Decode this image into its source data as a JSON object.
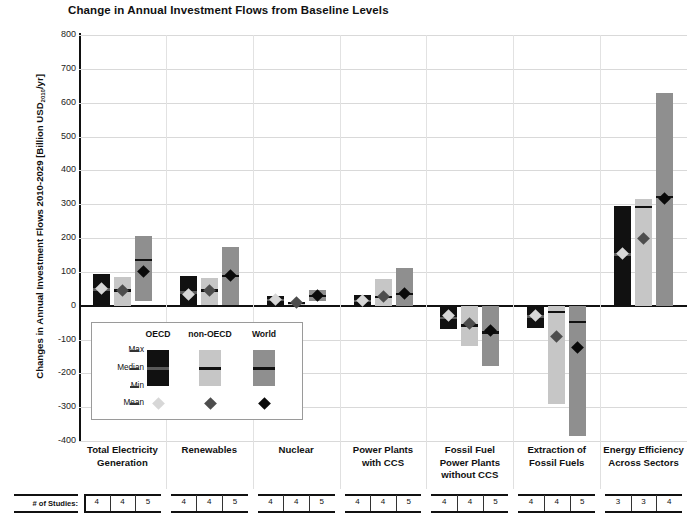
{
  "chart_data": {
    "type": "bar",
    "title": "Change in Annual Investment Flows from Baseline Levels",
    "ylabel": "Changes in Annual Investment Flows 2010-2029 [Billion USD2010/yr]",
    "ylabel_main": "Changes in Annual Investment Flows 2010-2029 [Billion USD",
    "ylabel_sub": "2010",
    "ylabel_tail": "/yr]",
    "xlabel": "",
    "ylim": [
      -400,
      800
    ],
    "ytick_values": [
      800,
      700,
      600,
      500,
      400,
      300,
      200,
      100,
      0,
      -100,
      -200,
      -300,
      -400
    ],
    "ytick_labels": [
      "800",
      "700",
      "600",
      "500",
      "400",
      "300",
      "200",
      "100",
      "0",
      "-100",
      "-200",
      "-300",
      "-400"
    ],
    "grid": true,
    "legend_position": "inside-lower-left",
    "series_names": [
      "OECD",
      "non-OECD",
      "World"
    ],
    "series_colors": [
      "#111111",
      "#c6c6c6",
      "#8f8f8f"
    ],
    "mean_marker_colors": [
      "#d7d7d7",
      "#4d4d4d",
      "#0a0a0a"
    ],
    "stat_labels": [
      "Max",
      "Median",
      "Min",
      "Mean"
    ],
    "studies_row_label": "# of Studies:",
    "categories": [
      "Total Electricity Generation",
      "Renewables",
      "Nuclear",
      "Power Plants with CCS",
      "Fossil Fuel Power Plants without CCS",
      "Extraction of Fossil Fuels",
      "Energy Efficiency Across Sectors"
    ],
    "category_lines": [
      [
        "Total Electricity",
        "Generation"
      ],
      [
        "Renewables"
      ],
      [
        "Nuclear"
      ],
      [
        "Power Plants",
        "with CCS"
      ],
      [
        "Fossil Fuel",
        "Power Plants",
        "without CCS"
      ],
      [
        "Extraction of",
        "Fossil Fuels"
      ],
      [
        "Energy Efficiency",
        "Across Sectors"
      ]
    ],
    "groups": [
      {
        "category": "Total Electricity Generation",
        "bars": [
          {
            "series": "OECD",
            "max": 95,
            "min": 0,
            "median": 48,
            "mean": 52,
            "studies": 4
          },
          {
            "series": "non-OECD",
            "max": 85,
            "min": 0,
            "median": 45,
            "mean": 45,
            "studies": 4
          },
          {
            "series": "World",
            "max": 205,
            "min": 15,
            "median": 135,
            "mean": 100,
            "studies": 5
          }
        ]
      },
      {
        "category": "Renewables",
        "bars": [
          {
            "series": "OECD",
            "max": 88,
            "min": 0,
            "median": 40,
            "mean": 32,
            "studies": 4
          },
          {
            "series": "non-OECD",
            "max": 82,
            "min": 2,
            "median": 45,
            "mean": 45,
            "studies": 4
          },
          {
            "series": "World",
            "max": 172,
            "min": 3,
            "median": 88,
            "mean": 88,
            "studies": 5
          }
        ]
      },
      {
        "category": "Nuclear",
        "bars": [
          {
            "series": "OECD",
            "max": 30,
            "min": 3,
            "median": 17,
            "mean": 17,
            "studies": 4
          },
          {
            "series": "non-OECD",
            "max": 12,
            "min": 3,
            "median": 8,
            "mean": 8,
            "studies": 4
          },
          {
            "series": "World",
            "max": 45,
            "min": 13,
            "median": 30,
            "mean": 30,
            "studies": 5
          }
        ]
      },
      {
        "category": "Power Plants with CCS",
        "bars": [
          {
            "series": "OECD",
            "max": 32,
            "min": 0,
            "median": 15,
            "mean": 15,
            "studies": 4
          },
          {
            "series": "non-OECD",
            "max": 78,
            "min": 0,
            "median": 27,
            "mean": 27,
            "studies": 4
          },
          {
            "series": "World",
            "max": 110,
            "min": 0,
            "median": 35,
            "mean": 35,
            "studies": 5
          }
        ]
      },
      {
        "category": "Fossil Fuel Power Plants without CCS",
        "bars": [
          {
            "series": "OECD",
            "max": 0,
            "min": -70,
            "median": -35,
            "mean": -30,
            "studies": 4
          },
          {
            "series": "non-OECD",
            "max": 0,
            "min": -120,
            "median": -58,
            "mean": -52,
            "studies": 4
          },
          {
            "series": "World",
            "max": 0,
            "min": -178,
            "median": -78,
            "mean": -72,
            "studies": 5
          }
        ]
      },
      {
        "category": "Extraction of Fossil Fuels",
        "bars": [
          {
            "series": "OECD",
            "max": 0,
            "min": -66,
            "median": -32,
            "mean": -30,
            "studies": 4
          },
          {
            "series": "non-OECD",
            "max": 0,
            "min": -290,
            "median": -18,
            "mean": -92,
            "studies": 4
          },
          {
            "series": "World",
            "max": 0,
            "min": -385,
            "median": -48,
            "mean": -125,
            "studies": 5
          }
        ]
      },
      {
        "category": "Energy Efficiency Across Sectors",
        "bars": [
          {
            "series": "OECD",
            "max": 295,
            "min": 0,
            "median": 152,
            "mean": 155,
            "studies": 3
          },
          {
            "series": "non-OECD",
            "max": 315,
            "min": 0,
            "median": 292,
            "mean": 200,
            "studies": 3
          },
          {
            "series": "World",
            "max": 630,
            "min": 0,
            "median": 322,
            "mean": 318,
            "studies": 4
          }
        ]
      }
    ]
  },
  "legend": {
    "headers": [
      "OECD",
      "non-OECD",
      "World"
    ],
    "rows": [
      "Max",
      "Median",
      "Min",
      "Mean"
    ]
  }
}
